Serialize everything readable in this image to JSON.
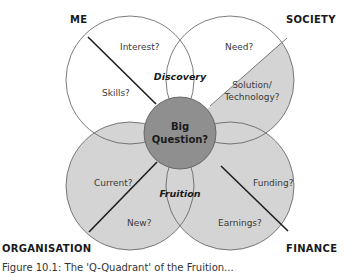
{
  "diagram": {
    "colors": {
      "white_fill": "#ffffff",
      "light_gray_fill": "#d4d4d4",
      "center_fill": "#8f8f8f",
      "outline": "#555555",
      "divider": "#1e1e1e"
    },
    "corners": {
      "top_left": "ME",
      "top_right": "SOCIETY",
      "bottom_left": "ORGANISATION",
      "bottom_right": "FINANCE"
    },
    "regions": {
      "me_upper": "Interest?",
      "me_lower": "Skills?",
      "society_upper": "Need?",
      "society_lower_line1": "Solution/",
      "society_lower_line2": "Technology?",
      "organisation_upper": "Current?",
      "organisation_lower": "New?",
      "finance_upper": "Funding?",
      "finance_lower": "Earnings?"
    },
    "lenses": {
      "top": "Discovery",
      "bottom": "Fruition"
    },
    "center": {
      "line1": "Big",
      "line2": "Question?"
    }
  },
  "caption": "Figure 10.1: The 'Q-Quadrant' of the Fruition..."
}
